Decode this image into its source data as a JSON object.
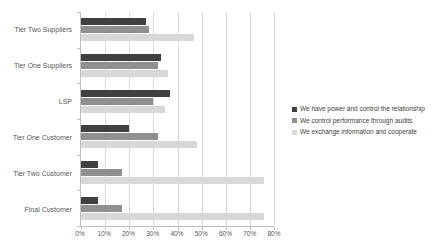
{
  "chart_data": {
    "type": "bar",
    "orientation": "horizontal",
    "title": "",
    "categories": [
      "Tier Two Suppliers",
      "Tier One Suppliers",
      "LSP",
      "Tier One Customer",
      "Tier Two Customer",
      "Final Customer"
    ],
    "series": [
      {
        "name": "We have power and control the relationship",
        "color": "#404040",
        "values": [
          27,
          33,
          37,
          20,
          7,
          7
        ]
      },
      {
        "name": "We control performance through audits",
        "color": "#8f8f8f",
        "values": [
          28,
          32,
          30,
          32,
          17,
          17
        ]
      },
      {
        "name": "We exchange information and cooperate",
        "color": "#d8d8d8",
        "values": [
          47,
          36,
          35,
          48,
          76,
          76
        ]
      }
    ],
    "xaxis": {
      "min": 0,
      "max": 80,
      "tick_step": 10,
      "tick_labels": [
        "0%",
        "10%",
        "20%",
        "30%",
        "40%",
        "50%",
        "60%",
        "70%",
        "80%"
      ]
    },
    "yaxis_label": "",
    "xlabel": "",
    "ylabel": "",
    "legend_position": "right",
    "grid": "vertical-only"
  },
  "colors": {
    "background": "#ffffff",
    "axis_line": "#bfbfbf",
    "gridline": "#dadada",
    "label_text": "#595959",
    "legend_text": "#404040"
  }
}
